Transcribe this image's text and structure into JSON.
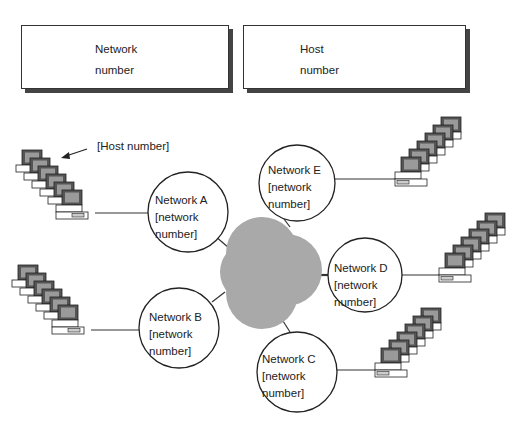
{
  "address_fields": [
    {
      "line1": "Network",
      "line2": "number"
    },
    {
      "line1": "Host",
      "line2": "number"
    }
  ],
  "annotation": {
    "label": "[Host number]"
  },
  "networks": [
    {
      "name": "Network A",
      "line2": "[network",
      "line3": "number]"
    },
    {
      "name": "Network B",
      "line2": "[network",
      "line3": "number]"
    },
    {
      "name": "Network C",
      "line2": "[network",
      "line3": "number]"
    },
    {
      "name": "Network D",
      "line2": "[network",
      "line3": "number]"
    },
    {
      "name": "Network E",
      "line2": "[network",
      "line3": "number]"
    }
  ],
  "colors": {
    "cloud": "#a9a9a9",
    "screen": "#9a9a9a",
    "stroke": "#333333"
  }
}
